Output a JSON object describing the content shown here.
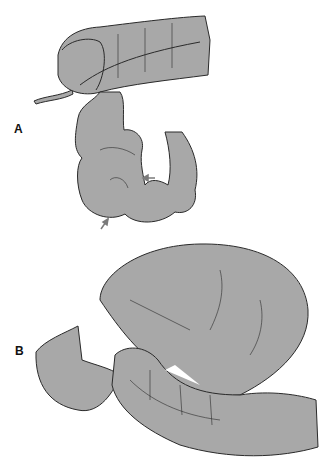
{
  "figure": {
    "panels": [
      {
        "label": "A",
        "description": "Colon with transverse segment and redundant looped sigmoid; arrows indicate twist points"
      },
      {
        "label": "B",
        "description": "Massively distended looped colon segment twisted upon itself"
      }
    ],
    "colors": {
      "fill": "#a8a8a8",
      "stroke": "#2a2a2a",
      "background": "#ffffff",
      "arrow": "#7a7a7a"
    }
  }
}
